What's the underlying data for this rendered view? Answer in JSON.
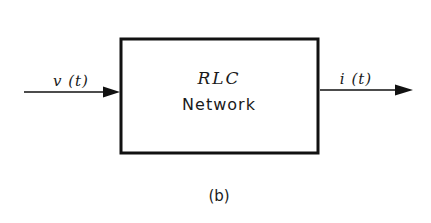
{
  "diagram": {
    "type": "block-diagram",
    "block": {
      "title": "RLC",
      "subtitle": "Network"
    },
    "input": {
      "label": "v (t)"
    },
    "output": {
      "label": "i (t)"
    },
    "caption": "(b)",
    "colors": {
      "stroke": "#111111",
      "background": "#ffffff",
      "text": "#1a1a1a"
    }
  }
}
